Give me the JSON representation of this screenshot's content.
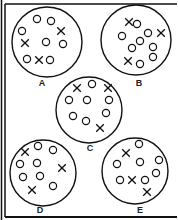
{
  "diagram": {
    "type": "particle-samples",
    "stroke_color": "#111111",
    "samples": [
      {
        "label": "A",
        "cx": 47,
        "cy": 42,
        "r": 35,
        "label_pos": [
          42,
          86
        ],
        "circles": [
          [
            37,
            19
          ],
          [
            51,
            21
          ],
          [
            22,
            31
          ],
          [
            46,
            42
          ],
          [
            63,
            44
          ],
          [
            27,
            59
          ],
          [
            50,
            60
          ]
        ],
        "crosses": [
          [
            61,
            31
          ],
          [
            25,
            43
          ],
          [
            39,
            60
          ]
        ]
      },
      {
        "label": "B",
        "cx": 136,
        "cy": 40,
        "r": 35,
        "label_pos": [
          139,
          86
        ],
        "circles": [
          [
            137,
            24
          ],
          [
            122,
            36
          ],
          [
            148,
            33
          ],
          [
            140,
            41
          ],
          [
            153,
            47
          ],
          [
            132,
            48
          ],
          [
            153,
            57
          ],
          [
            140,
            64
          ]
        ],
        "crosses": [
          [
            129,
            22
          ],
          [
            161,
            33
          ],
          [
            128,
            61
          ]
        ]
      },
      {
        "label": "C",
        "cx": 89,
        "cy": 110,
        "r": 33,
        "label_pos": [
          90,
          151
        ],
        "circles": [
          [
            92,
            84
          ],
          [
            69,
            100
          ],
          [
            87,
            100
          ],
          [
            109,
            100
          ],
          [
            73,
            116
          ],
          [
            106,
            113
          ],
          [
            86,
            121
          ]
        ],
        "crosses": [
          [
            77,
            88
          ],
          [
            108,
            88
          ],
          [
            100,
            128
          ]
        ]
      },
      {
        "label": "D",
        "cx": 43,
        "cy": 173,
        "r": 33,
        "label_pos": [
          40,
          213
        ],
        "circles": [
          [
            38,
            146
          ],
          [
            53,
            150
          ],
          [
            20,
            164
          ],
          [
            37,
            163
          ],
          [
            23,
            177
          ],
          [
            40,
            176
          ],
          [
            53,
            186
          ]
        ],
        "crosses": [
          [
            25,
            152
          ],
          [
            62,
            168
          ],
          [
            32,
            190
          ]
        ]
      },
      {
        "label": "E",
        "cx": 135,
        "cy": 171,
        "r": 33,
        "label_pos": [
          140,
          213
        ],
        "circles": [
          [
            139,
            144
          ],
          [
            117,
            164
          ],
          [
            140,
            162
          ],
          [
            159,
            160
          ],
          [
            120,
            180
          ],
          [
            145,
            180
          ],
          [
            156,
            173
          ]
        ],
        "crosses": [
          [
            126,
            153
          ],
          [
            132,
            180
          ],
          [
            147,
            192
          ]
        ]
      }
    ]
  }
}
